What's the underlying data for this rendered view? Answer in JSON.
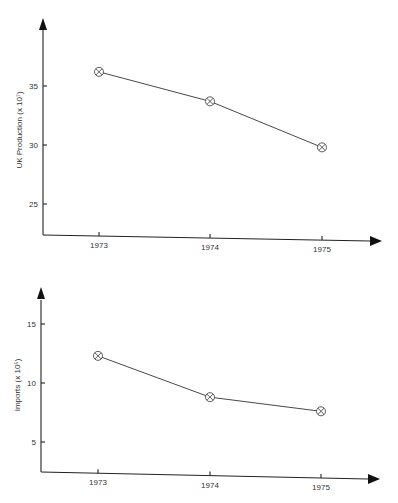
{
  "chart_data": [
    {
      "type": "line",
      "title": "",
      "xlabel": "",
      "ylabel": "UK Production (x 10^7)",
      "ylabel_display": "UK Production (x 10⁷)",
      "categories": [
        "1973",
        "1974",
        "1975"
      ],
      "values": [
        36.2,
        33.7,
        29.8
      ],
      "yticks": [
        "25",
        "30",
        "35"
      ],
      "ylim": [
        22.5,
        40
      ],
      "marker": "circle-x",
      "grid": false,
      "legend": null
    },
    {
      "type": "line",
      "title": "",
      "xlabel": "",
      "ylabel": "Imports (x 10^5)",
      "ylabel_display": "Imports (x 10⁵)",
      "categories": [
        "1973",
        "1974",
        "1975"
      ],
      "values": [
        12.3,
        8.8,
        7.6
      ],
      "yticks": [
        "5",
        "10",
        "15"
      ],
      "ylim": [
        2.5,
        17.5
      ],
      "marker": "circle-x",
      "grid": false,
      "legend": null
    }
  ]
}
